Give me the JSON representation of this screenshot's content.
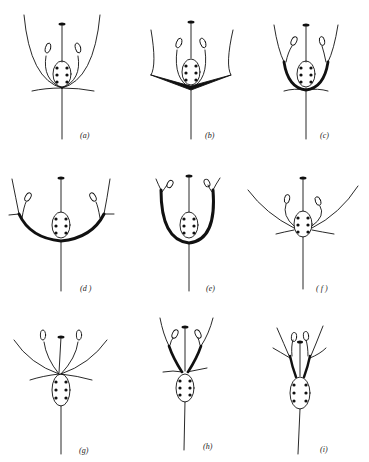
{
  "figure": {
    "background": "#ffffff",
    "ink": "#111111",
    "panels": [
      {
        "id": "a",
        "label": "(a)",
        "type": "hypogynous-cup-open"
      },
      {
        "id": "b",
        "label": "(b)",
        "type": "hypogynous-flat-receptacle"
      },
      {
        "id": "c",
        "label": "(c)",
        "type": "perigynous-shallow-cup"
      },
      {
        "id": "d",
        "label": "(d )",
        "type": "perigynous-wide-saucer"
      },
      {
        "id": "e",
        "label": "(e)",
        "type": "perigynous-deep-cup"
      },
      {
        "id": "f",
        "label": "( f )",
        "type": "half-epigynous"
      },
      {
        "id": "g",
        "label": "(g)",
        "type": "epigynous"
      },
      {
        "id": "h",
        "label": "(h)",
        "type": "epigynous-with-short-tube"
      },
      {
        "id": "i",
        "label": "(i)",
        "type": "epigynous-with-long-tube"
      }
    ]
  }
}
